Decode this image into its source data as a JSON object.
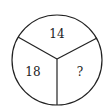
{
  "diagram": {
    "type": "circle-divided-into-three-sectors",
    "sectors": [
      {
        "position": "top",
        "value": "14"
      },
      {
        "position": "left",
        "value": "18"
      },
      {
        "position": "right",
        "value": "?"
      }
    ],
    "stroke_color": "#222222",
    "background_color": "#ffffff"
  }
}
